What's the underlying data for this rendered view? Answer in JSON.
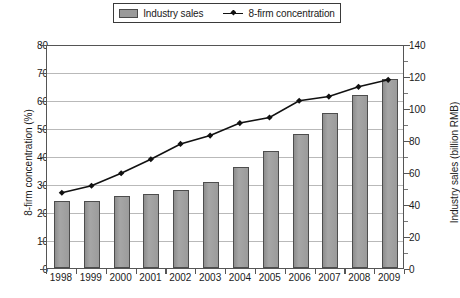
{
  "legend": {
    "items": [
      {
        "label": "Industry sales",
        "marker": "bar-swatch-icon",
        "color": "#9a9a9a"
      },
      {
        "label": "8-firm concentration",
        "marker": "line-marker-icon",
        "color": "#111111"
      }
    ]
  },
  "chart_data": {
    "type": "bar",
    "title": "",
    "subtitle": "",
    "xlabel": "",
    "ylabel": "8-firm concentration (%)",
    "y2label": "Industry sales (billion RMB)",
    "categories": [
      "1998",
      "1999",
      "2000",
      "2001",
      "2002",
      "2003",
      "2004",
      "2005",
      "2006",
      "2007",
      "2008",
      "2009"
    ],
    "series": [
      {
        "name": "Industry sales",
        "type": "bar",
        "axis": "right",
        "unit": "billion RMB",
        "color": "#9a9a9a",
        "values": [
          42,
          42,
          45,
          46,
          49,
          54,
          63,
          73,
          84,
          97,
          108,
          118
        ]
      },
      {
        "name": "8-firm concentration",
        "type": "line",
        "axis": "left",
        "unit": "%",
        "color": "#111111",
        "values": [
          27,
          29.5,
          34,
          39,
          44.5,
          47.5,
          52,
          54,
          60,
          61.5,
          65,
          67.5
        ]
      }
    ],
    "ylim": [
      0,
      80
    ],
    "yticks": [
      0,
      10,
      20,
      30,
      40,
      50,
      60,
      70,
      80
    ],
    "y2lim": [
      0,
      140
    ],
    "y2ticks": [
      0,
      20,
      40,
      60,
      80,
      100,
      120,
      140
    ],
    "y2_minor_ticks": [
      10,
      30,
      50,
      70,
      90,
      110,
      130
    ],
    "grid": true,
    "legend_position": "top-center"
  }
}
